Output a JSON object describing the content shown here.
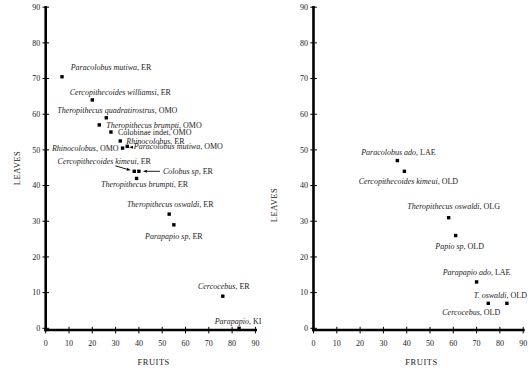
{
  "figure": {
    "background": "#ffffff",
    "ink_color": "#1b1b1b",
    "axis_color": "#000000"
  },
  "chart_data": [
    {
      "type": "scatter",
      "title": "",
      "xlabel": "FRUITS",
      "ylabel": "LEAVES",
      "xlim": [
        0,
        90
      ],
      "ylim": [
        0,
        90
      ],
      "xticks": [
        0,
        10,
        20,
        30,
        40,
        50,
        60,
        70,
        80,
        90
      ],
      "yticks": [
        0,
        10,
        20,
        30,
        40,
        50,
        60,
        70,
        80,
        90
      ],
      "grid": false,
      "legend": false,
      "marker": {
        "shape": "square",
        "size": 3.4,
        "color": "#000000"
      },
      "points": [
        {
          "taxon": "Paracolobus mutiwa",
          "site": "ER",
          "x": 7,
          "y": 70.5,
          "italic": true,
          "label": {
            "anchor": "middle",
            "dx": 49,
            "dy": -7
          }
        },
        {
          "taxon": "Cercopithecoides williamsi",
          "site": "ER",
          "x": 20,
          "y": 64,
          "italic": true,
          "label": {
            "anchor": "middle",
            "dx": 28,
            "dy": -5
          }
        },
        {
          "taxon": "Theropithecus quadratirostrus",
          "site": "OMO",
          "x": 26,
          "y": 59,
          "italic": true,
          "label": {
            "anchor": "middle",
            "dx": 11,
            "dy": -5
          }
        },
        {
          "taxon": "Theropithecus brumpti",
          "site": "OMO",
          "x": 23,
          "y": 57,
          "italic": true,
          "label": {
            "anchor": "start",
            "dx": 7,
            "dy": 3
          }
        },
        {
          "taxon": "Colobinae indet",
          "site": "OMO",
          "x": 28,
          "y": 55,
          "italic": false,
          "label": {
            "anchor": "start",
            "dx": 7,
            "dy": 3
          }
        },
        {
          "taxon": "Rhinocolobus",
          "site": "ER",
          "x": 32,
          "y": 52.5,
          "italic": true,
          "label": {
            "anchor": "start",
            "dx": 6,
            "dy": 3
          }
        },
        {
          "taxon": "Rhinocolobus",
          "site": "OMO",
          "x": 33,
          "y": 50.5,
          "italic": true,
          "label": {
            "anchor": "end",
            "dx": -4,
            "dy": 3
          }
        },
        {
          "taxon": "Paracolobus mutiwa",
          "site": "OMO",
          "x": 35,
          "y": 51,
          "italic": true,
          "label": {
            "anchor": "start",
            "dx": 6.5,
            "dy": 3
          },
          "arrow": {
            "x1": 5.8,
            "y1": 1,
            "x2": 1.8,
            "y2": 1
          }
        },
        {
          "taxon": "Cercopithecoides kimeui",
          "site": "ER",
          "x": 38,
          "y": 44,
          "italic": true,
          "label": {
            "anchor": "middle",
            "dx": -30,
            "dy": -7
          },
          "arrow": {
            "x1": -19,
            "y1": -5.5,
            "x2": -3.5,
            "y2": -1
          }
        },
        {
          "taxon": "Colobus sp",
          "site": "ER",
          "x": 40,
          "y": 44,
          "italic": true,
          "label": {
            "anchor": "start",
            "dx": 24,
            "dy": 2.5
          },
          "arrow": {
            "x1": 21,
            "y1": 0,
            "x2": 4,
            "y2": 0
          }
        },
        {
          "taxon": "Theropithecus brumpti",
          "site": "ER",
          "x": 39,
          "y": 42,
          "italic": true,
          "label": {
            "anchor": "middle",
            "dx": 8,
            "dy": 8.5
          }
        },
        {
          "taxon": "Theropithecus oswaldi",
          "site": "ER",
          "x": 53,
          "y": 32,
          "italic": true,
          "label": {
            "anchor": "middle",
            "dx": 1,
            "dy": -7
          }
        },
        {
          "taxon": "Parapapio sp",
          "site": "ER",
          "x": 55,
          "y": 29,
          "italic": true,
          "label": {
            "anchor": "middle",
            "dx": 0,
            "dy": 14
          }
        },
        {
          "taxon": "Cercocebus",
          "site": "ER",
          "x": 76,
          "y": 9,
          "italic": true,
          "label": {
            "anchor": "middle",
            "dx": 1,
            "dy": -7.5
          }
        },
        {
          "taxon": "Parapapio",
          "site": "KI",
          "x": 83,
          "y": 0,
          "italic": true,
          "label": {
            "anchor": "middle",
            "dx": -1,
            "dy": -4.5
          }
        }
      ]
    },
    {
      "type": "scatter",
      "title": "",
      "xlabel": "FRUITS",
      "ylabel": "LEAVES",
      "xlim": [
        0,
        90
      ],
      "ylim": [
        0,
        90
      ],
      "xticks": [
        0,
        10,
        20,
        30,
        40,
        50,
        60,
        70,
        80,
        90
      ],
      "yticks": [
        0,
        10,
        20,
        30,
        40,
        50,
        60,
        70,
        80,
        90
      ],
      "grid": false,
      "legend": false,
      "marker": {
        "shape": "square",
        "size": 3.4,
        "color": "#000000"
      },
      "points": [
        {
          "taxon": "Paracolobus ado",
          "site": "LAE",
          "x": 36,
          "y": 47,
          "italic": true,
          "label": {
            "anchor": "middle",
            "dx": 1,
            "dy": -6
          }
        },
        {
          "taxon": "Cercopithecoides kimeui",
          "site": "OLD",
          "x": 39,
          "y": 44,
          "italic": true,
          "label": {
            "anchor": "middle",
            "dx": 4,
            "dy": 12.5
          }
        },
        {
          "taxon": "Theropithecus oswaldi",
          "site": "OLG",
          "x": 58,
          "y": 31,
          "italic": true,
          "label": {
            "anchor": "middle",
            "dx": 5,
            "dy": -8.5
          }
        },
        {
          "taxon": "Papio sp",
          "site": "OLD",
          "x": 61,
          "y": 26,
          "italic": true,
          "label": {
            "anchor": "middle",
            "dx": 4,
            "dy": 13.5
          }
        },
        {
          "taxon": "Parapapio ado",
          "site": "LAE",
          "x": 70,
          "y": 13,
          "italic": true,
          "label": {
            "anchor": "middle",
            "dx": 0,
            "dy": -6.5
          }
        },
        {
          "taxon": "Cercocebus",
          "site": "OLD",
          "x": 75,
          "y": 7,
          "italic": true,
          "label": {
            "anchor": "middle",
            "dx": -17,
            "dy": 12
          }
        },
        {
          "taxon": "T. oswaldi",
          "site": "OLD",
          "x": 83,
          "y": 7,
          "italic": true,
          "label": {
            "anchor": "middle",
            "dx": -6.5,
            "dy": -5.5
          }
        }
      ]
    }
  ]
}
